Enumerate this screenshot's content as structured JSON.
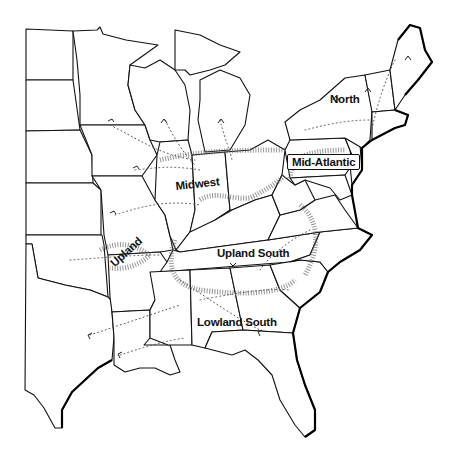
{
  "map": {
    "title": "",
    "regions": [
      {
        "id": "north",
        "label": "North"
      },
      {
        "id": "mid-atlantic",
        "label": "Mid-Atlantic"
      },
      {
        "id": "midwest",
        "label": "Midwest"
      },
      {
        "id": "upland",
        "label": "Upland"
      },
      {
        "id": "upland-south",
        "label": "Upland South"
      },
      {
        "id": "lowland-south",
        "label": "Lowland South"
      }
    ],
    "legend": null,
    "colors": {
      "ink": "#111111",
      "background": "#ffffff",
      "flow_lines": "#555555"
    }
  }
}
